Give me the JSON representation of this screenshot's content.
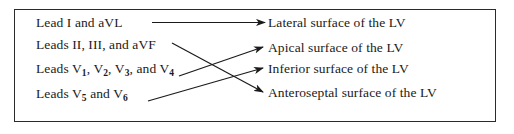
{
  "figure": {
    "border_color": "#2b2b2b",
    "text_color": "#1a1a1a",
    "arrow_color": "#1a1a1a",
    "background": "#ffffff"
  },
  "left_items": [
    {
      "id": "lead-i-avl",
      "text_html": "Lead I and aVL",
      "plain": "Lead I and aVL"
    },
    {
      "id": "leads-ii-iii-avf",
      "text_html": "Leads II, III, and aVF",
      "plain": "Leads II, III, and aVF"
    },
    {
      "id": "leads-v1-v4",
      "text_html": "Leads V<sub>1</sub>, V<sub>2</sub>, V<sub>3</sub>, and V<sub>4</sub>",
      "plain": "Leads V1, V2, V3, and V4"
    },
    {
      "id": "leads-v5-v6",
      "text_html": "Leads V<sub>5</sub> and V<sub>6</sub>",
      "plain": "Leads V5 and V6"
    }
  ],
  "right_items": [
    {
      "id": "lateral",
      "text": "Lateral surface of the LV"
    },
    {
      "id": "apical",
      "text": "Apical surface of the LV"
    },
    {
      "id": "inferior",
      "text": "Inferior surface of the LV"
    },
    {
      "id": "anteroseptal",
      "text": "Anteroseptal surface of the LV"
    }
  ],
  "connections": [
    {
      "from": "lead-i-avl",
      "to": "lateral",
      "kind": "straight-horizontal"
    },
    {
      "from": "leads-ii-iii-avf",
      "to": "anteroseptal",
      "kind": "descending"
    },
    {
      "from": "leads-v1-v4",
      "to": "apical",
      "kind": "ascending"
    },
    {
      "from": "leads-v5-v6",
      "to": "inferior",
      "kind": "ascending"
    }
  ],
  "icons": {
    "arrowhead": "arrowhead-icon"
  }
}
